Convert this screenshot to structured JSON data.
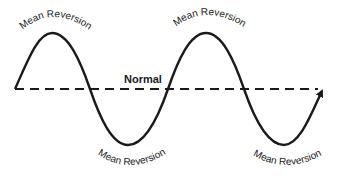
{
  "diagram": {
    "baseline_label": "Normal",
    "labels": {
      "peak_1": "Mean Reversion",
      "peak_2": "Mean Reversion",
      "trough_1": "Mean Reversion",
      "trough_2": "Mean Reversion"
    },
    "colors": {
      "line": "#1a1a1a",
      "background": "#ffffff"
    },
    "cycles": 2,
    "ends_with_arrow": true
  }
}
